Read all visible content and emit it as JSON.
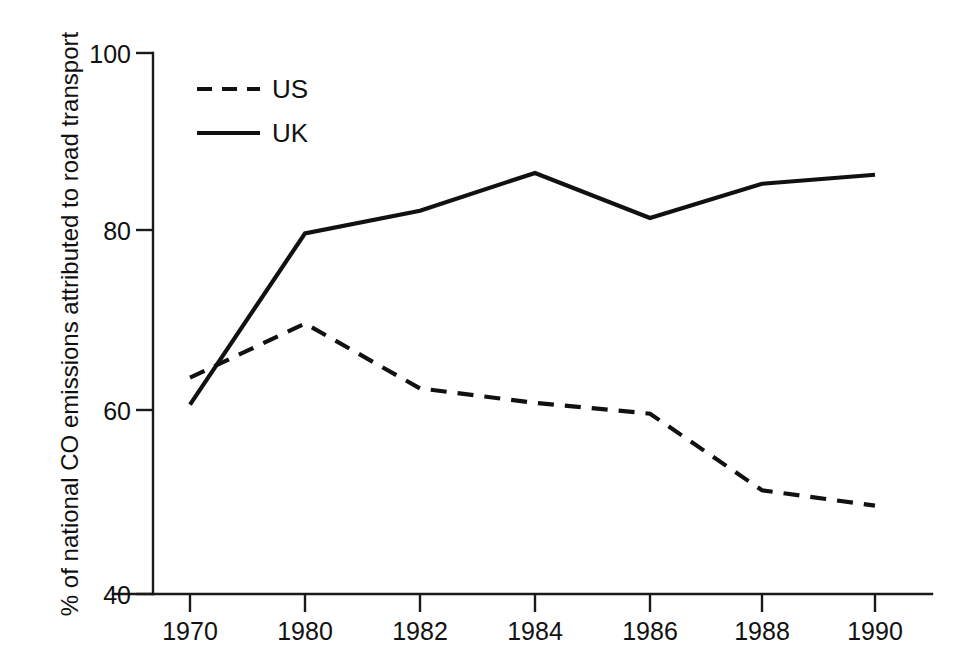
{
  "chart_data": {
    "type": "line",
    "title": "",
    "subtitle": "",
    "xlabel": "",
    "ylabel": "% of national CO emissions attributed to road transport",
    "categories": [
      "1970",
      "1980",
      "1982",
      "1984",
      "1986",
      "1988",
      "1990"
    ],
    "x": [
      1970,
      1980,
      1982,
      1984,
      1986,
      1988,
      1990
    ],
    "x_scale": "categorical-equal-spacing",
    "series": [
      {
        "name": "US",
        "style": "dashed",
        "color": "#111111",
        "values": [
          64,
          70,
          62.8,
          61.2,
          60,
          51.5,
          49.8
        ]
      },
      {
        "name": "UK",
        "style": "solid",
        "color": "#111111",
        "values": [
          61,
          80,
          82.5,
          86.7,
          81.7,
          85.5,
          86.5
        ]
      }
    ],
    "ylim": [
      40,
      100
    ],
    "yticks": [
      40,
      60,
      80,
      100
    ],
    "ytick_labels": [
      "40",
      "60",
      "80",
      "100"
    ],
    "xtick_labels": [
      "1970",
      "1980",
      "1982",
      "1984",
      "1986",
      "1988",
      "1990"
    ],
    "grid": false,
    "legend_position": "top-left-inside",
    "legend": [
      {
        "label": "US",
        "style": "dashed"
      },
      {
        "label": "UK",
        "style": "solid"
      }
    ],
    "annotations": []
  },
  "axes": {
    "y_title": "% of national CO emissions attributed to road transport",
    "y_tick_100": "100",
    "y_tick_80": "80",
    "y_tick_60": "60",
    "y_tick_40": "40",
    "x_tick_1970": "1970",
    "x_tick_1980": "1980",
    "x_tick_1982": "1982",
    "x_tick_1984": "1984",
    "x_tick_1986": "1986",
    "x_tick_1988": "1988",
    "x_tick_1990": "1990"
  },
  "legend": {
    "us_label": "US",
    "uk_label": "UK"
  },
  "colors": {
    "ink": "#111111",
    "background": "#ffffff"
  }
}
